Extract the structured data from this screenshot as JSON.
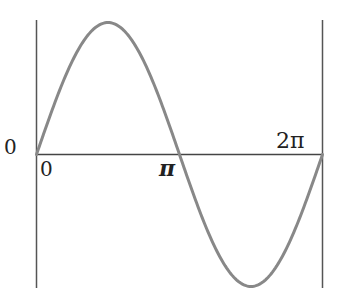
{
  "chart_data": {
    "type": "line",
    "title": "",
    "xlabel": "",
    "ylabel": "",
    "series": [
      {
        "name": "sin(x)",
        "function": "sin",
        "x_range": [
          0,
          6.283185307
        ],
        "color": "#888888"
      }
    ],
    "tick_labels": {
      "origin_left": "0",
      "x_zero": "0",
      "x_pi": "π",
      "x_two_pi": "2π"
    },
    "xlim": [
      0,
      6.283185307
    ],
    "ylim": [
      -1,
      1
    ],
    "grid": false,
    "legend": "none"
  },
  "colors": {
    "curve": "#888888",
    "axis": "#555555",
    "text": "#222222"
  }
}
